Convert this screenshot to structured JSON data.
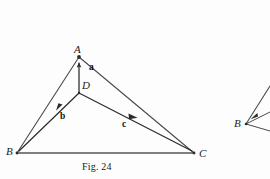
{
  "figure": {
    "caption": "Fig. 24",
    "vertices": [
      {
        "id": "A",
        "label": "A",
        "x": 79,
        "y": 57
      },
      {
        "id": "B",
        "label": "B",
        "x": 17,
        "y": 153
      },
      {
        "id": "C",
        "label": "C",
        "x": 194,
        "y": 153
      },
      {
        "id": "D",
        "label": "D",
        "x": 79,
        "y": 93
      }
    ],
    "vectors": [
      {
        "id": "a",
        "label": "a",
        "from": "D",
        "to": "A"
      },
      {
        "id": "b",
        "label": "b",
        "from": "D",
        "to": "B"
      },
      {
        "id": "c",
        "label": "c",
        "from": "D",
        "to": "C"
      }
    ],
    "edges": [
      {
        "from": "B",
        "to": "A"
      },
      {
        "from": "A",
        "to": "C"
      },
      {
        "from": "B",
        "to": "C"
      }
    ],
    "partial_figure": {
      "vertex_label": "B"
    }
  },
  "colors": {
    "ink": "#2b2b2b",
    "line": "#555555",
    "paper": "#fdfdfd"
  }
}
